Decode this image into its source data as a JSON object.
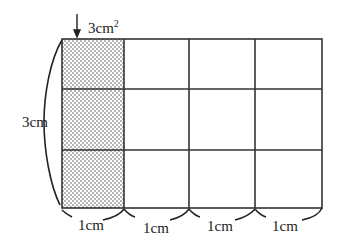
{
  "diagram": {
    "grid": {
      "cols": 4,
      "rows": 3,
      "shaded_column": 1
    },
    "labels": {
      "shaded_area": "3cm",
      "shaded_area_sup": "2",
      "height": "3cm",
      "widths": [
        "1cm",
        "1cm",
        "1cm",
        "1cm"
      ]
    },
    "colors": {
      "line": "#333333",
      "dots": "#555555",
      "background": "#ffffff"
    }
  }
}
